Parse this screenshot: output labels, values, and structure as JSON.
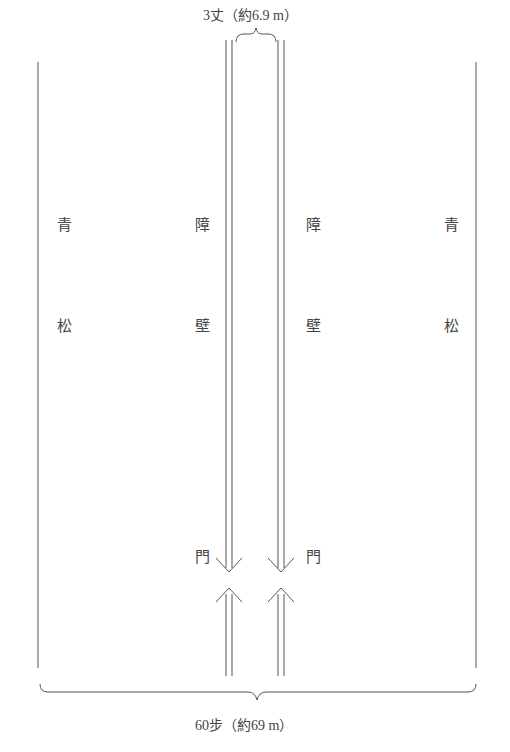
{
  "diagram": {
    "top_caption": "3丈（約6.9 m）",
    "bottom_caption": "60步（約69 m）",
    "labels": {
      "left_pine_1": "青",
      "left_pine_2": "松",
      "left_wall_1": "障",
      "left_wall_2": "壁",
      "right_wall_1": "障",
      "right_wall_2": "壁",
      "right_pine_1": "青",
      "right_pine_2": "松",
      "left_gate": "門",
      "right_gate": "門"
    },
    "colors": {
      "line": "#555555",
      "text": "#444444"
    }
  }
}
